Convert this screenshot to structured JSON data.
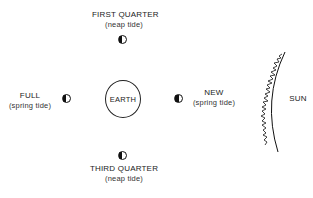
{
  "diagram": {
    "center_body": {
      "label": "EARTH"
    },
    "sun": {
      "label": "SUN"
    },
    "moon_phases": [
      {
        "id": "first-quarter",
        "label": "FIRST QUARTER",
        "tide": "(neap tide)",
        "position": "top",
        "icon": "half-moon-icon"
      },
      {
        "id": "full",
        "label": "FULL",
        "tide": "(spring tide)",
        "position": "left",
        "icon": "half-moon-icon"
      },
      {
        "id": "new",
        "label": "NEW",
        "tide": "(spring tide)",
        "position": "right",
        "icon": "half-moon-icon"
      },
      {
        "id": "third-quarter",
        "label": "THIRD QUARTER",
        "tide": "(neap tide)",
        "position": "bottom",
        "icon": "half-moon-icon"
      }
    ],
    "colors": {
      "ink": "#111111",
      "background": "#ffffff"
    }
  }
}
